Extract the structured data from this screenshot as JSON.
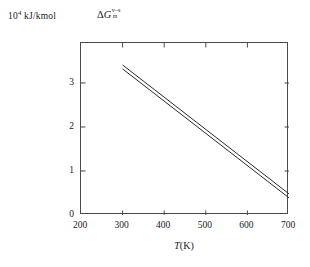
{
  "figure": {
    "units_label_prefix": "10",
    "units_label_exponent": "4",
    "units_label_suffix": " kJ/kmol",
    "quantity_delta": "Δ",
    "quantity_symbol": "G",
    "quantity_superscript": "v–s",
    "quantity_subscript": "m",
    "xaxis_title_symbol": "T",
    "xaxis_title_units": "(K)",
    "frame_color": "#4a4a4a",
    "line_color": "#2b2b2b",
    "background_color": "#ffffff"
  },
  "chart_data": {
    "type": "line",
    "title": "",
    "xlabel": "T(K)",
    "ylabel": "ΔG_m^(v–s)  /  10^4 kJ/kmol",
    "xlim": [
      200,
      700
    ],
    "ylim": [
      0,
      3.909
    ],
    "xticks": [
      200,
      300,
      400,
      500,
      600,
      700
    ],
    "yticks": [
      0,
      1,
      2,
      3
    ],
    "xtick_labels": [
      "200",
      "300",
      "400",
      "500",
      "600",
      "700"
    ],
    "ytick_labels": [
      "0",
      "1",
      "2",
      "3"
    ],
    "grid": false,
    "legend": false,
    "series": [
      {
        "name": "upper",
        "x": [
          300,
          700
        ],
        "values": [
          3.41,
          0.48
        ]
      },
      {
        "name": "lower",
        "x": [
          300,
          700
        ],
        "values": [
          3.32,
          0.39
        ]
      }
    ]
  }
}
